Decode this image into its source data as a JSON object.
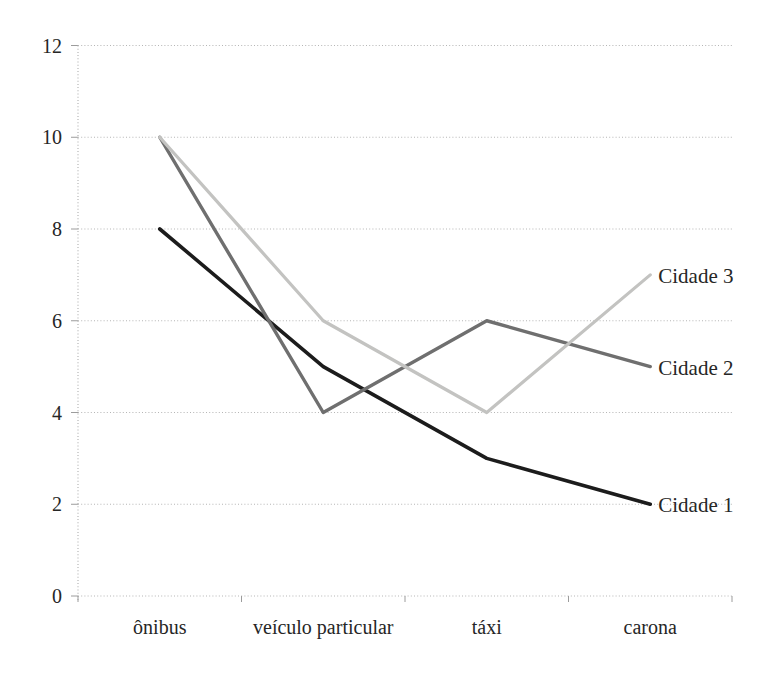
{
  "figure": {
    "background": "#ffffff"
  },
  "chart_data": {
    "type": "line",
    "title": "",
    "xlabel": "",
    "ylabel": "",
    "categories": [
      "ônibus",
      "veículo particular",
      "táxi",
      "carona"
    ],
    "series": [
      {
        "name": "Cidade 1",
        "values": [
          8,
          5,
          3,
          2
        ],
        "color": "#1c1c1c",
        "stroke_width": 3.6
      },
      {
        "name": "Cidade 2",
        "values": [
          10,
          4,
          6,
          5
        ],
        "color": "#6f6f6f",
        "stroke_width": 3.4
      },
      {
        "name": "Cidade 3",
        "values": [
          10,
          6,
          4,
          7
        ],
        "color": "#c3c3c1",
        "stroke_width": 3.2
      }
    ],
    "ylim": [
      0,
      12
    ],
    "yticks": [
      0,
      2,
      4,
      6,
      8,
      10,
      12
    ],
    "grid": "horizontal-dotted",
    "legend_position": "line-end-labels",
    "grid_color": "#b5b5b5",
    "tick_color": "#9c9c9c",
    "text_color": "#262626"
  }
}
